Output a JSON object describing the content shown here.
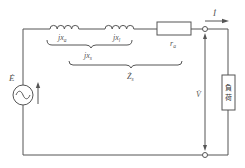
{
  "diagram": {
    "type": "equivalent-circuit",
    "colors": {
      "line": "#555555",
      "text": "#555555",
      "background": "#ffffff"
    },
    "source": {
      "label": "Ė",
      "symbol": "ac-source"
    },
    "elements": [
      {
        "id": "xa",
        "kind": "inductor",
        "label": "jx",
        "sub": "a"
      },
      {
        "id": "xl",
        "kind": "inductor",
        "label": "jx",
        "sub": "l"
      },
      {
        "id": "ra",
        "kind": "resistor",
        "label": "r",
        "sub": "a"
      }
    ],
    "braces": {
      "xs": {
        "label": "jx",
        "sub": "s"
      },
      "zs": {
        "label": "Ż",
        "sub": "s"
      }
    },
    "current": {
      "label": "İ"
    },
    "voltage": {
      "label": "V̇"
    },
    "load": {
      "label_line1": "負",
      "label_line2": "荷"
    }
  }
}
